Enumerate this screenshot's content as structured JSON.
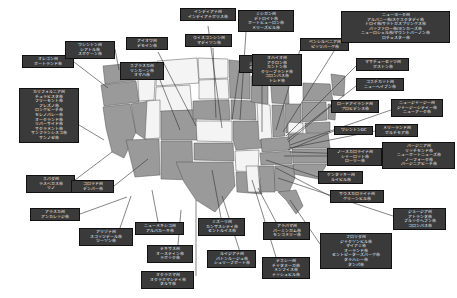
{
  "map": {
    "title": "アメリカ合衆国 州別都市マップ",
    "region_label": "United States",
    "colors": {
      "background": "#ffffff",
      "state_fill_light": "#f4f4f4",
      "state_fill_highlight": "#9a9a9a",
      "state_border": "#555555",
      "callout_background": "#3a3a3a",
      "callout_text": "#ffffff",
      "leader_line": "#333333"
    }
  },
  "callouts": [
    {
      "id": "oregon",
      "x": 22,
      "y": 55,
      "w": 52,
      "lines": [
        "オレゴン州",
        "ポートランド市"
      ]
    },
    {
      "id": "washington",
      "x": 65,
      "y": 41,
      "w": 50,
      "lines": [
        "ワシントン州",
        "シアトル市",
        "スポケーン市"
      ]
    },
    {
      "id": "california",
      "x": 19,
      "y": 88,
      "w": 60,
      "lines": [
        "カリフォルニア州",
        "チュラビスタ市",
        "フリーモント市",
        "フレズノ市",
        "ロングビーチ市",
        "モレノバレー市",
        "オークランド市",
        "リバーサイド市",
        "サクラメント市",
        "サンフランシスコ市",
        "サンノゼ市"
      ]
    },
    {
      "id": "nevada",
      "x": 26,
      "y": 175,
      "w": 49,
      "lines": [
        "ネバダ州",
        "ラスベガス市",
        "リノ"
      ]
    },
    {
      "id": "alaska",
      "x": 30,
      "y": 208,
      "w": 50,
      "lines": [
        "アラスカ州",
        "アンカレッジ市"
      ]
    },
    {
      "id": "arizona",
      "x": 79,
      "y": 228,
      "w": 54,
      "lines": [
        "アリゾナ州",
        "スコッツデール市",
        "ツーソン市"
      ]
    },
    {
      "id": "colorado",
      "x": 71,
      "y": 180,
      "w": 43,
      "lines": [
        "コロラド州",
        "デンバー市"
      ]
    },
    {
      "id": "iowa",
      "x": 126,
      "y": 37,
      "w": 42,
      "lines": [
        "アイオワ州",
        "デモイン市"
      ]
    },
    {
      "id": "nebraska",
      "x": 120,
      "y": 62,
      "w": 44,
      "lines": [
        "ネブラスカ州",
        "リンカーン市",
        "オマハ市"
      ]
    },
    {
      "id": "newmexico",
      "x": 135,
      "y": 222,
      "w": 49,
      "lines": [
        "ニューメキシコ州",
        "アルバカーキ市"
      ]
    },
    {
      "id": "texas",
      "x": 147,
      "y": 245,
      "w": 46,
      "lines": [
        "テキサス州",
        "オースティン市",
        "ラボック市"
      ]
    },
    {
      "id": "oklahoma",
      "x": 141,
      "y": 271,
      "w": 53,
      "lines": [
        "オクラホマ州",
        "オクラホマシティ市",
        "タルサ市"
      ]
    },
    {
      "id": "missouri",
      "x": 198,
      "y": 218,
      "w": 47,
      "lines": [
        "ミズーリ州",
        "カンザスシティ市",
        "セントルイス市"
      ]
    },
    {
      "id": "louisiana",
      "x": 207,
      "y": 250,
      "w": 49,
      "lines": [
        "ルイジアナ州",
        "バトンルージュ市",
        "シュリーブポート市"
      ]
    },
    {
      "id": "indiana",
      "x": 180,
      "y": 8,
      "w": 56,
      "lines": [
        "インディアナ州",
        "インディアナポリス市"
      ]
    },
    {
      "id": "wisconsin",
      "x": 185,
      "y": 34,
      "w": 47,
      "lines": [
        "ウィスコンシン州",
        "マディソン市"
      ]
    },
    {
      "id": "minnesota",
      "x": 239,
      "y": 55,
      "w": 48,
      "lines": [
        "ミネソタ州",
        "ミネアポリス市",
        "セントポール市"
      ]
    },
    {
      "id": "michigan",
      "x": 238,
      "y": 10,
      "w": 56,
      "lines": [
        "ミシガン州",
        "デトロイト市",
        "ポートヒューロン市",
        "メリーズビル市"
      ]
    },
    {
      "id": "ohio",
      "x": 252,
      "y": 54,
      "w": 50,
      "lines": [
        "オハイオ州",
        "アクロン市",
        "カントン市",
        "クリーブランド市",
        "コロンバス市",
        "トレド市"
      ]
    },
    {
      "id": "pennsylvania",
      "x": 300,
      "y": 38,
      "w": 49,
      "lines": [
        "ペンシルベニア州",
        "ピッツバーグ市"
      ]
    },
    {
      "id": "newyork",
      "x": 341,
      "y": 11,
      "w": 109,
      "lines": [
        "ニューヨーク州",
        "アルバニー市/スケネクタディ市",
        "トロイ市/サラトガスプリングス市",
        "バッファロー市/ヨンカーズ市",
        "ニューロシェル市/マウントバーノン市",
        "ロチェスター市"
      ]
    },
    {
      "id": "massachusetts",
      "x": 356,
      "y": 58,
      "w": 53,
      "lines": [
        "マサチューセッツ州",
        "ボストン市"
      ]
    },
    {
      "id": "connecticut",
      "x": 356,
      "y": 78,
      "w": 48,
      "lines": [
        "コネチカット州",
        "ニューヘイブン市"
      ]
    },
    {
      "id": "rhodeisland",
      "x": 331,
      "y": 100,
      "w": 48,
      "lines": [
        "ロードアイランド州",
        "プロビデンス市"
      ]
    },
    {
      "id": "newjersey",
      "x": 391,
      "y": 99,
      "w": 52,
      "lines": [
        "ニュージャージー州",
        "ジャージーシティー市",
        "ニューアーク市"
      ]
    },
    {
      "id": "washingtondc",
      "x": 334,
      "y": 126,
      "w": 39,
      "lines": [
        "ワシントンDC"
      ]
    },
    {
      "id": "maryland",
      "x": 375,
      "y": 124,
      "w": 43,
      "lines": [
        "メリーランド州",
        "ボルチモア市"
      ]
    },
    {
      "id": "virginia",
      "x": 382,
      "y": 142,
      "w": 73,
      "lines": [
        "バージニア州",
        "リッチモンド市",
        "ニューポートニューズ市",
        "ノーフォーク市",
        "バージニアビーチ市"
      ]
    },
    {
      "id": "northcarolina",
      "x": 327,
      "y": 148,
      "w": 55,
      "lines": [
        "ノースカロライナ州",
        "シャーロット市",
        "ローリー市"
      ]
    },
    {
      "id": "kentucky",
      "x": 318,
      "y": 171,
      "w": 45,
      "lines": [
        "ケンタッキー州",
        "ルイビル市"
      ]
    },
    {
      "id": "southcarolina",
      "x": 330,
      "y": 190,
      "w": 54,
      "lines": [
        "サウスカロライナ州",
        "グリーンビル市"
      ]
    },
    {
      "id": "georgia",
      "x": 393,
      "y": 208,
      "w": 53,
      "lines": [
        "ジョージア州",
        "アトランタ市",
        "ブルックヘブン市",
        "コロンバス市"
      ]
    },
    {
      "id": "alabama",
      "x": 263,
      "y": 222,
      "w": 47,
      "lines": [
        "アラバマ州",
        "バーミンガム市",
        "モンゴメリー市"
      ]
    },
    {
      "id": "tennessee",
      "x": 262,
      "y": 257,
      "w": 48,
      "lines": [
        "テネシー州",
        "チャタヌーガ市",
        "メンフィス市",
        "ナッシュビル市"
      ]
    },
    {
      "id": "florida",
      "x": 320,
      "y": 233,
      "w": 72,
      "lines": [
        "フロリダ州",
        "ジャクソンビル市",
        "マイアミ市",
        "オーランド市",
        "セントピーターズバーグ市",
        "タラハシー市",
        "タンパ市"
      ]
    }
  ],
  "leaders": [
    {
      "id": "oregon-leader",
      "x1": 74,
      "y1": 62,
      "x2": 108,
      "y2": 88
    },
    {
      "id": "washington-leader",
      "x1": 115,
      "y1": 49,
      "x2": 119,
      "y2": 70
    },
    {
      "id": "california-leader",
      "x1": 79,
      "y1": 125,
      "x2": 104,
      "y2": 140
    },
    {
      "id": "nevada-leader",
      "x1": 75,
      "y1": 180,
      "x2": 112,
      "y2": 152
    },
    {
      "id": "alaska-leader",
      "x1": 80,
      "y1": 214,
      "x2": 127,
      "y2": 197
    },
    {
      "id": "arizona-leader",
      "x1": 120,
      "y1": 228,
      "x2": 131,
      "y2": 196
    },
    {
      "id": "colorado-leader",
      "x1": 114,
      "y1": 186,
      "x2": 148,
      "y2": 159
    },
    {
      "id": "iowa-leader",
      "x1": 158,
      "y1": 52,
      "x2": 196,
      "y2": 126
    },
    {
      "id": "nebraska-leader",
      "x1": 160,
      "y1": 80,
      "x2": 180,
      "y2": 130
    },
    {
      "id": "newmexico-leader",
      "x1": 158,
      "y1": 222,
      "x2": 152,
      "y2": 190
    },
    {
      "id": "texas-leader",
      "x1": 178,
      "y1": 245,
      "x2": 181,
      "y2": 210
    },
    {
      "id": "oklahoma-leader",
      "x1": 196,
      "y1": 276,
      "x2": 196,
      "y2": 200
    },
    {
      "id": "missouri-leader",
      "x1": 221,
      "y1": 218,
      "x2": 212,
      "y2": 170
    },
    {
      "id": "louisiana-leader",
      "x1": 240,
      "y1": 252,
      "x2": 222,
      "y2": 196
    },
    {
      "id": "indiana-leader",
      "x1": 208,
      "y1": 26,
      "x2": 222,
      "y2": 128
    },
    {
      "id": "wisconsin-leader",
      "x1": 213,
      "y1": 48,
      "x2": 216,
      "y2": 118
    },
    {
      "id": "minnesota-leader",
      "x1": 239,
      "y1": 70,
      "x2": 232,
      "y2": 120
    },
    {
      "id": "michigan-leader",
      "x1": 246,
      "y1": 32,
      "x2": 240,
      "y2": 120
    },
    {
      "id": "ohio-leader",
      "x1": 262,
      "y1": 86,
      "x2": 262,
      "y2": 132
    },
    {
      "id": "pennsylvania-leader",
      "x1": 300,
      "y1": 50,
      "x2": 276,
      "y2": 130
    },
    {
      "id": "newyork-leader",
      "x1": 341,
      "y1": 40,
      "x2": 283,
      "y2": 132
    },
    {
      "id": "massachusetts-leader",
      "x1": 356,
      "y1": 66,
      "x2": 286,
      "y2": 136
    },
    {
      "id": "connecticut-leader",
      "x1": 356,
      "y1": 86,
      "x2": 287,
      "y2": 140
    },
    {
      "id": "rhodeisland-leader",
      "x1": 331,
      "y1": 106,
      "x2": 288,
      "y2": 142
    },
    {
      "id": "newjersey-leader",
      "x1": 391,
      "y1": 110,
      "x2": 290,
      "y2": 145
    },
    {
      "id": "washingtondc-leader",
      "x1": 334,
      "y1": 131,
      "x2": 288,
      "y2": 150
    },
    {
      "id": "maryland-leader",
      "x1": 375,
      "y1": 131,
      "x2": 290,
      "y2": 148
    },
    {
      "id": "virginia-leader",
      "x1": 382,
      "y1": 155,
      "x2": 290,
      "y2": 152
    },
    {
      "id": "northcarolina-leader",
      "x1": 327,
      "y1": 156,
      "x2": 284,
      "y2": 156
    },
    {
      "id": "kentucky-leader",
      "x1": 318,
      "y1": 177,
      "x2": 266,
      "y2": 160
    },
    {
      "id": "southcarolina-leader",
      "x1": 330,
      "y1": 196,
      "x2": 276,
      "y2": 168
    },
    {
      "id": "georgia-leader",
      "x1": 393,
      "y1": 216,
      "x2": 278,
      "y2": 178
    },
    {
      "id": "alabama-leader",
      "x1": 276,
      "y1": 222,
      "x2": 258,
      "y2": 188
    },
    {
      "id": "tennessee-leader",
      "x1": 276,
      "y1": 257,
      "x2": 252,
      "y2": 180
    },
    {
      "id": "florida-leader",
      "x1": 320,
      "y1": 244,
      "x2": 290,
      "y2": 200
    }
  ]
}
